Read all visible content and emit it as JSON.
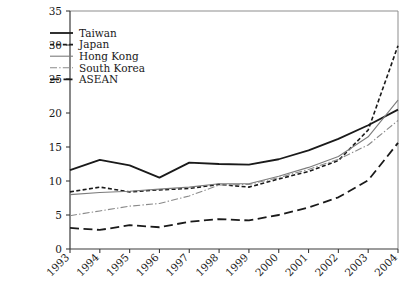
{
  "chart_data": {
    "type": "line",
    "title": "",
    "subtitle": "",
    "xlabel": "",
    "ylabel": "",
    "categories": [
      "1993",
      "1994",
      "1995",
      "1996",
      "1997",
      "1998",
      "1999",
      "2000",
      "2001",
      "2002",
      "2003",
      "2004"
    ],
    "x": [
      1993,
      1994,
      1995,
      1996,
      1997,
      1998,
      1999,
      2000,
      2001,
      2002,
      2003,
      2004
    ],
    "xlim": [
      1993,
      2004
    ],
    "ylim": [
      0,
      35
    ],
    "yticks": [
      0,
      5,
      10,
      15,
      20,
      25,
      30,
      35
    ],
    "ytick_labels": [
      "0",
      "5",
      "10",
      "15",
      "20",
      "25",
      "30",
      "35"
    ],
    "grid": false,
    "legend_position": "top-left",
    "series": [
      {
        "name": "Taiwan",
        "style": "solid",
        "color": "#1a1a1a",
        "width": 1.8,
        "values": [
          11.6,
          13.1,
          12.3,
          10.5,
          12.7,
          12.5,
          12.4,
          13.2,
          14.5,
          16.2,
          18.2,
          20.5
        ]
      },
      {
        "name": "Japan",
        "style": "dashed",
        "color": "#1a1a1a",
        "width": 1.6,
        "values": [
          8.4,
          9.1,
          8.4,
          8.7,
          8.9,
          9.5,
          9.1,
          10.3,
          11.4,
          13.0,
          17.5,
          29.9
        ]
      },
      {
        "name": "Hong Kong",
        "style": "solid",
        "color": "#7c7c7c",
        "width": 1.1,
        "values": [
          8.0,
          8.3,
          8.5,
          8.8,
          9.1,
          9.6,
          9.6,
          10.7,
          12.0,
          13.6,
          16.5,
          21.9
        ]
      },
      {
        "name": "South Korea",
        "style": "dashdot",
        "color": "#8a8a8a",
        "width": 1.1,
        "values": [
          4.9,
          5.6,
          6.3,
          6.7,
          7.8,
          9.4,
          9.5,
          10.5,
          11.7,
          13.2,
          15.3,
          18.9
        ]
      },
      {
        "name": "ASEAN",
        "style": "longdash",
        "color": "#1a1a1a",
        "width": 1.8,
        "values": [
          3.1,
          2.8,
          3.5,
          3.2,
          4.0,
          4.4,
          4.2,
          5.0,
          6.1,
          7.6,
          10.1,
          15.6
        ]
      }
    ]
  },
  "legend": {
    "entries": [
      {
        "label": "Taiwan"
      },
      {
        "label": "Japan"
      },
      {
        "label": "Hong Kong"
      },
      {
        "label": "South Korea"
      },
      {
        "label": "ASEAN"
      }
    ]
  },
  "colors": {
    "background": "#ffffff",
    "axis": "#3a3a3a",
    "frame": "#8d8d8d",
    "text": "#1a1a1a",
    "dark_series": "#1a1a1a",
    "gray_series": "#7c7c7c"
  }
}
